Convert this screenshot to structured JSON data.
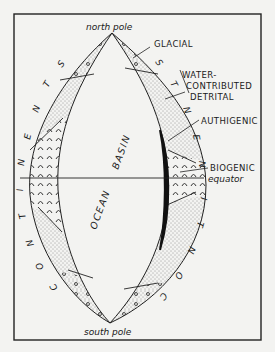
{
  "figure": {
    "top_label": "north pole",
    "bottom_label": "south pole",
    "equator_label": "equator",
    "basin_words": [
      "OCEAN",
      "BASIN"
    ],
    "continent_label": "CONTINENTS",
    "left_letters": [
      "S",
      "T",
      "N",
      "E",
      "N",
      "I",
      "T",
      "N",
      "O",
      "C"
    ],
    "right_letters": [
      "S",
      "T",
      "N",
      "E",
      "N",
      "I",
      "T",
      "N",
      "O",
      "C"
    ],
    "legend": [
      {
        "key": "glacial",
        "label": "GLACIAL"
      },
      {
        "key": "water_detrital",
        "label_lines": [
          "WATER-",
          "CONTRIBUTED",
          "DETRITAL"
        ]
      },
      {
        "key": "authigenic",
        "label": "AUTHIGENIC"
      },
      {
        "key": "biogenic",
        "label": "BIOGENIC"
      }
    ]
  },
  "colors": {
    "ink": "#1a1a1a",
    "paper": "#f3f3f1"
  }
}
